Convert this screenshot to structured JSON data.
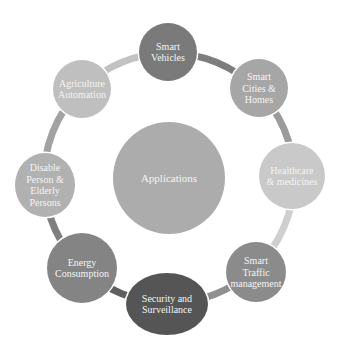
{
  "diagram": {
    "type": "cycle",
    "center": {
      "label": "Applications",
      "cx": 169,
      "cy": 178,
      "r": 56,
      "color": "#acacac"
    },
    "ring": {
      "cx": 169,
      "cy": 178,
      "r": 125
    },
    "connectors": [
      {
        "from": 0,
        "to": 1,
        "color": "#7d7d7d"
      },
      {
        "from": 1,
        "to": 2,
        "color": "#9b9b9b"
      },
      {
        "from": 2,
        "to": 3,
        "color": "#cfcfcf"
      },
      {
        "from": 3,
        "to": 4,
        "color": "#8f8f8f"
      },
      {
        "from": 4,
        "to": 5,
        "color": "#5f5f5f"
      },
      {
        "from": 5,
        "to": 6,
        "color": "#7f7f7f"
      },
      {
        "from": 6,
        "to": 7,
        "color": "#a2a2a2"
      },
      {
        "from": 7,
        "to": 0,
        "color": "#c2c2c2"
      }
    ],
    "nodes": [
      {
        "id": "smart-vehicles",
        "lines": [
          "Smart",
          "Vehicles"
        ],
        "cx": 168,
        "cy": 52,
        "rx": 29,
        "ry": 29,
        "color": "#7a7a7a"
      },
      {
        "id": "smart-cities-homes",
        "lines": [
          "Smart",
          "Cities &",
          "Homes"
        ],
        "cx": 259,
        "cy": 88,
        "rx": 29,
        "ry": 29,
        "color": "#a6a6a6"
      },
      {
        "id": "healthcare-medicines",
        "lines": [
          "Healthcare",
          "& medicines"
        ],
        "cx": 292,
        "cy": 176,
        "rx": 33,
        "ry": 33,
        "color": "#c9c9c9"
      },
      {
        "id": "smart-traffic-management",
        "lines": [
          "Smart",
          "Traffic",
          "management"
        ],
        "cx": 256,
        "cy": 272,
        "rx": 30,
        "ry": 30,
        "color": "#8b8b8b"
      },
      {
        "id": "security-surveillance",
        "lines": [
          "Security and",
          "Surveillance"
        ],
        "cx": 167,
        "cy": 304,
        "rx": 41,
        "ry": 31,
        "color": "#555555"
      },
      {
        "id": "energy-consumption",
        "lines": [
          "Energy",
          "Consumption"
        ],
        "cx": 82,
        "cy": 268,
        "rx": 35,
        "ry": 35,
        "color": "#848484"
      },
      {
        "id": "disable-elderly-persons",
        "lines": [
          "Disable",
          "Person &",
          "Elderly",
          "Persons"
        ],
        "cx": 45,
        "cy": 185,
        "rx": 30,
        "ry": 32,
        "color": "#b1b1b1"
      },
      {
        "id": "agriculture-automation",
        "lines": [
          "Agriculture",
          "Automation"
        ],
        "cx": 82,
        "cy": 89,
        "rx": 29,
        "ry": 29,
        "color": "#bfbfbf"
      }
    ]
  }
}
